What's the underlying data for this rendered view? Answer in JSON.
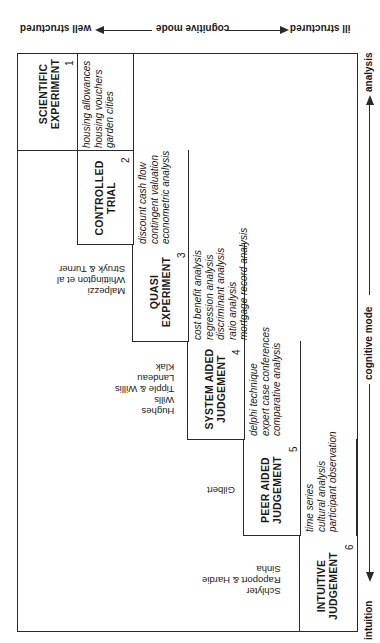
{
  "top_axis": {
    "left_label": "ill structured",
    "center_label": "cognitive mode",
    "right_label": "well structured"
  },
  "bottom_axis": {
    "start_label": "intuition",
    "center_label": "cognitive mode",
    "end_label": "analysis"
  },
  "steps": [
    {
      "number": "1",
      "title_line1": "SCIENTIFIC",
      "title_line2": "EXPERIMENT",
      "methods": [
        "housing allowances",
        "housing vouchers",
        "garden cities"
      ],
      "authors": []
    },
    {
      "number": "2",
      "title_line1": "CONTROLLED",
      "title_line2": "TRIAL",
      "methods": [
        "discount cash flow",
        "contingent valuation",
        "econometric analysis"
      ],
      "authors": []
    },
    {
      "number": "3",
      "title_line1": "QUASI",
      "title_line2": "EXPERIMENT",
      "methods": [
        "cost benefit analysis",
        "regression analysis",
        "discriminant analysis",
        "ratio analysis",
        "mortgage record analysis"
      ],
      "authors": [
        "Malpezzi",
        "Whittington et al",
        "Struyk & Turner"
      ]
    },
    {
      "number": "4",
      "title_line1": "SYSTEM AIDED",
      "title_line2": "JUDGEMENT",
      "methods": [
        "delphi technique",
        "expert case conferences",
        "comparative analysis"
      ],
      "authors": [
        "Hughes",
        "Wills",
        "Tipple & Willis",
        "Landeau",
        "Klak"
      ]
    },
    {
      "number": "5",
      "title_line1": "PEER AIDED",
      "title_line2": "JUDGEMENT",
      "methods": [
        "time series",
        "cultural analysis",
        "participant observation"
      ],
      "authors": [
        "Gilbert"
      ]
    },
    {
      "number": "6",
      "title_line1": "INTUITIVE",
      "title_line2": "JUDGEMENT",
      "methods": [],
      "authors": [
        "Schlyter",
        "Rapoport & Hardie",
        "Sinha"
      ]
    }
  ]
}
